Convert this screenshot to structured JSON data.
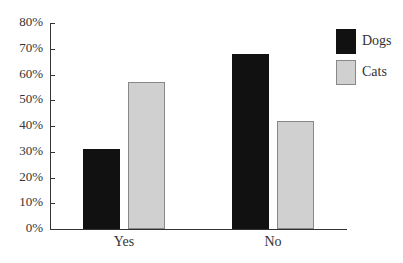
{
  "chart_data": {
    "type": "bar",
    "title": "",
    "xlabel": "",
    "ylabel": "",
    "categories": [
      "Yes",
      "No"
    ],
    "series": [
      {
        "name": "Dogs",
        "values": [
          31,
          68
        ],
        "color": "#111111"
      },
      {
        "name": "Cats",
        "values": [
          57,
          42
        ],
        "color": "#d0d0d0"
      }
    ],
    "ylim": [
      0,
      80
    ],
    "yticks": [
      "0%",
      "10%",
      "20%",
      "30%",
      "40%",
      "50%",
      "60%",
      "70%",
      "80%"
    ],
    "grid": false,
    "legend_position": "top-right"
  }
}
